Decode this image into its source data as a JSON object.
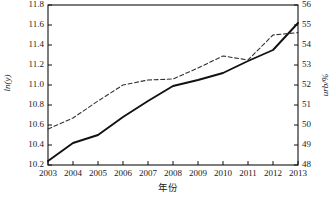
{
  "chart_data": {
    "type": "line",
    "title": "",
    "xlabel": "年份",
    "x": [
      2003,
      2004,
      2005,
      2006,
      2007,
      2008,
      2009,
      2010,
      2011,
      2012,
      2013
    ],
    "xticklabels": [
      "2003",
      "2004",
      "2005",
      "2006",
      "2007",
      "2008",
      "2009",
      "2010",
      "2011",
      "2012",
      "2013"
    ],
    "grid": false,
    "legend": "none",
    "axes": [
      {
        "side": "left",
        "ylabel": "ln(y)",
        "ylim": [
          10.2,
          11.8
        ],
        "yticks": [
          10.2,
          10.4,
          10.6,
          10.8,
          11.0,
          11.2,
          11.4,
          11.6,
          11.8
        ],
        "yticklabels": [
          "10.2",
          "10.4",
          "10.6",
          "10.8",
          "11.0",
          "11.2",
          "11.4",
          "11.6",
          "11.8"
        ]
      },
      {
        "side": "right",
        "ylabel": "urb/%",
        "ylim": [
          48,
          56
        ],
        "yticks": [
          48,
          49,
          50,
          51,
          52,
          53,
          54,
          55,
          56
        ],
        "yticklabels": [
          "48",
          "49",
          "50",
          "51",
          "52",
          "53",
          "54",
          "55",
          "56"
        ]
      }
    ],
    "series": [
      {
        "name": "ln(y)",
        "axis": "left",
        "style": "solid",
        "color": "#111111",
        "values": [
          10.24,
          10.42,
          10.5,
          10.68,
          10.84,
          10.99,
          11.05,
          11.12,
          11.24,
          11.35,
          11.62
        ]
      },
      {
        "name": "urb/%",
        "axis": "right",
        "style": "dashed",
        "color": "#333333",
        "values": [
          49.8,
          50.35,
          51.2,
          52.0,
          52.25,
          52.3,
          52.85,
          53.45,
          53.25,
          54.5,
          54.62
        ]
      }
    ]
  },
  "axis_labels": {
    "left": "ln(y)",
    "right": "urb/%",
    "bottom": "年份"
  }
}
